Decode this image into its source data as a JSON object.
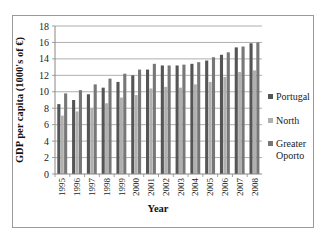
{
  "chart_data": {
    "type": "bar",
    "title": "",
    "xlabel": "Year",
    "ylabel": "GDP per capita (1000's of €)",
    "ylim": [
      0,
      18
    ],
    "yticks": [
      0,
      2,
      4,
      6,
      8,
      10,
      12,
      14,
      16,
      18
    ],
    "grid": true,
    "legend_position": "right",
    "categories": [
      "1995",
      "1996",
      "1997",
      "1998",
      "1999",
      "2000",
      "2001",
      "2002",
      "2003",
      "2004",
      "2005",
      "2006",
      "2007",
      "2008"
    ],
    "series": [
      {
        "name": "Portugal",
        "color": "#555555",
        "values": [
          8.5,
          9.0,
          9.7,
          10.5,
          11.2,
          12.0,
          12.7,
          13.2,
          13.2,
          13.4,
          13.8,
          14.5,
          15.4,
          15.9
        ]
      },
      {
        "name": "North",
        "color": "#b0b0b0",
        "values": [
          7.1,
          7.6,
          8.0,
          8.6,
          9.3,
          9.6,
          10.4,
          10.6,
          10.5,
          10.9,
          11.2,
          11.8,
          12.4,
          12.6
        ]
      },
      {
        "name": "Greater Oporto",
        "color": "#777777",
        "values": [
          9.8,
          10.2,
          10.9,
          11.6,
          12.2,
          12.7,
          13.4,
          13.2,
          13.3,
          13.6,
          14.2,
          14.8,
          15.5,
          16.0
        ]
      }
    ]
  },
  "legend": {
    "items": [
      {
        "label": "Portugal"
      },
      {
        "label": "North"
      },
      {
        "label_line1": "Greater",
        "label_line2": "Oporto"
      }
    ]
  },
  "axes": {
    "x_title": "Year",
    "y_title": "GDP per capita (1000's of €)"
  }
}
